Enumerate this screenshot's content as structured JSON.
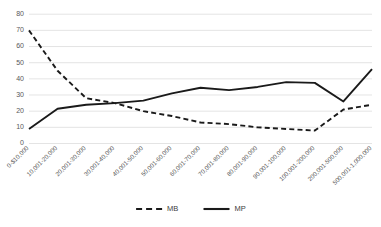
{
  "chart_data": {
    "type": "line",
    "title": "",
    "xlabel": "",
    "ylabel": "",
    "ylim": [
      0,
      80
    ],
    "ytick_step": 10,
    "grid": true,
    "legend_position": "bottom-center",
    "yticks": [
      "0",
      "10",
      "20",
      "30",
      "40",
      "50",
      "60",
      "70",
      "80"
    ],
    "categories": [
      "0-$10,000",
      "10,001-20,000",
      "20,001-30,000",
      "30,001-40,000",
      "40,001-50,000",
      "50,001-60,000",
      "60,001-70,000",
      "70,001-80,000",
      "80,001-90,000",
      "90,001-100,000",
      "100,001-200,000",
      "200,001-500,000",
      "500,001-1,000,000"
    ],
    "series": [
      {
        "name": "MB",
        "style": "dashed",
        "color": "#1a1a1a",
        "values": [
          70,
          45,
          28,
          25,
          20,
          17,
          13,
          12,
          10,
          9,
          8,
          21,
          24
        ]
      },
      {
        "name": "MP",
        "style": "solid",
        "color": "#1a1a1a",
        "values": [
          9,
          21.5,
          24,
          25,
          26.5,
          31,
          34.5,
          33,
          35,
          38,
          37.5,
          26,
          46
        ]
      }
    ]
  },
  "legend": {
    "entries": [
      {
        "label": "MB",
        "style": "dashed"
      },
      {
        "label": "MP",
        "style": "solid"
      }
    ]
  }
}
